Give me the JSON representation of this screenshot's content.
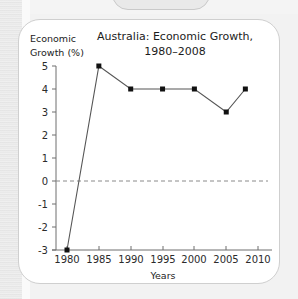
{
  "card": {
    "background_color": "#ffffff",
    "border_color": "#cfcfcf",
    "page_background_color": "#f2f2f2"
  },
  "chart_data": {
    "type": "line",
    "title": "Australia: Economic Growth,",
    "title_line2": "1980–2008",
    "xlabel": "Years",
    "ylabel": "Economic",
    "ylabel_line2": "Growth (%)",
    "x": [
      1980,
      1985,
      1990,
      1995,
      2000,
      2005,
      2008
    ],
    "values": [
      -3,
      5,
      4,
      4,
      4,
      3,
      4
    ],
    "xlim": [
      1978,
      2011
    ],
    "ylim": [
      -3,
      5
    ],
    "xticks": [
      1980,
      1985,
      1990,
      1995,
      2000,
      2005,
      2010
    ],
    "xtick_labels": [
      "1980",
      "1985",
      "1990",
      "1995",
      "2000",
      "2005",
      "2010"
    ],
    "yticks": [
      5,
      4,
      3,
      2,
      1,
      0,
      -1,
      -2,
      -3
    ],
    "ytick_labels": [
      "5",
      "4",
      "3",
      "2",
      "1",
      "0",
      "-1",
      "-2",
      "-3"
    ],
    "grid": false,
    "zero_reference_line": 0,
    "legend": null,
    "marker": "square",
    "marker_color": "#111111",
    "line_color": "#555555"
  }
}
